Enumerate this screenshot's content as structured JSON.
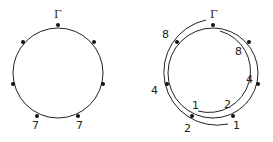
{
  "left_diagram": {
    "top_label": "Γ",
    "bottom_left_label": "7",
    "bottom_right_label": "7",
    "dot_count": 7
  },
  "right_diagram": {
    "top_label": "Γ",
    "outer_arc_labels": {
      "upper_left": "8",
      "left": "4",
      "bottom": "2",
      "bottom_right_end": "1"
    },
    "inner_arc_labels": {
      "upper_right": "8",
      "right": "4",
      "bottom_mid": "2",
      "bottom_left_end": "1"
    },
    "dot_count": 7
  },
  "colors": {
    "stroke": "#222222",
    "background": "#ffffff"
  }
}
